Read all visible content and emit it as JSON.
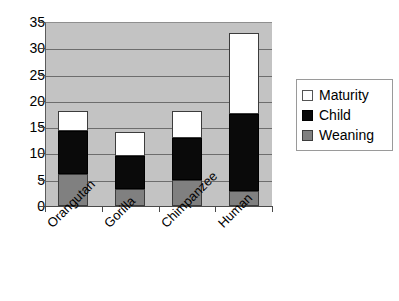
{
  "chart_data": {
    "type": "bar",
    "subtype": "stacked-bar",
    "title": "",
    "xlabel": "",
    "ylabel": "",
    "categories": [
      "Orangutan",
      "Gorilla",
      "Chimpanzee",
      "Human"
    ],
    "series": [
      {
        "name": "Weaning",
        "color": "#808080",
        "values": [
          6.0,
          3.2,
          5.0,
          2.9
        ]
      },
      {
        "name": "Child",
        "color": "#000000",
        "values": [
          8.3,
          6.3,
          8.0,
          14.6
        ]
      },
      {
        "name": "Maturity",
        "color": "#ffffff",
        "values": [
          3.7,
          4.5,
          5.0,
          15.5
        ]
      }
    ],
    "cumulative_tops": {
      "Orangutan": {
        "weaning": 6.0,
        "child": 14.3,
        "maturity": 18.0
      },
      "Gorilla": {
        "weaning": 3.2,
        "child": 9.5,
        "maturity": 14.0
      },
      "Chimpanzee": {
        "weaning": 5.0,
        "child": 13.0,
        "maturity": 18.0
      },
      "Human": {
        "weaning": 2.9,
        "child": 17.5,
        "maturity": 33.0
      }
    },
    "ylim": [
      0,
      35
    ],
    "ytick_labels": [
      "0",
      "5",
      "10",
      "15",
      "20",
      "25",
      "30",
      "35"
    ],
    "ytick_values": [
      0,
      5,
      10,
      15,
      20,
      25,
      30,
      35
    ],
    "grid": true,
    "grid_axis": "y",
    "legend_position": "right",
    "legend_entries": [
      "Maturity",
      "Child",
      "Weaning"
    ],
    "plot_background": "#c3c3c3",
    "xlabel_rotation_deg": -45
  },
  "legend": {
    "rows": [
      {
        "label": "Maturity",
        "swatch": "swatch-white"
      },
      {
        "label": "Child",
        "swatch": "swatch-black"
      },
      {
        "label": "Weaning",
        "swatch": "swatch-gray"
      }
    ]
  }
}
